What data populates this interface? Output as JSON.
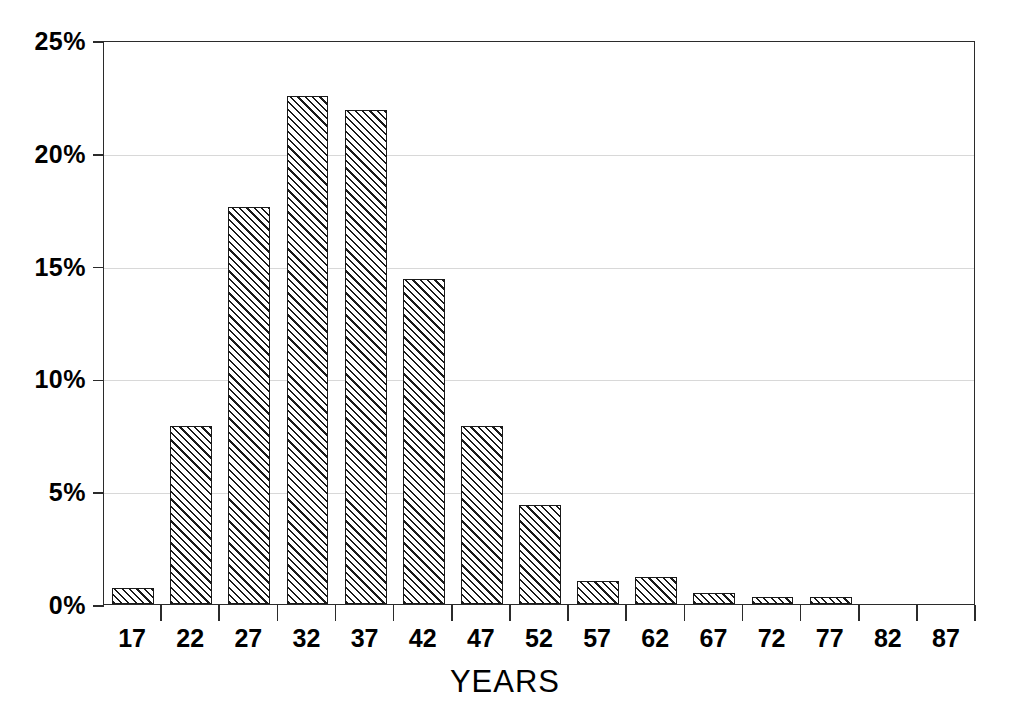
{
  "chart_data": {
    "type": "bar",
    "title": "",
    "subtitle": "",
    "xlabel": "YEARS",
    "ylabel": "",
    "categories": [
      "17",
      "22",
      "27",
      "32",
      "37",
      "42",
      "47",
      "52",
      "57",
      "62",
      "67",
      "72",
      "77",
      "82",
      "87"
    ],
    "values": [
      0.7,
      7.9,
      17.6,
      22.5,
      21.9,
      14.4,
      7.9,
      4.4,
      1.0,
      1.2,
      0.5,
      0.3,
      0.3,
      0.0,
      0.0
    ],
    "value_unit": "%",
    "ylim": [
      0,
      25
    ],
    "ytick_values": [
      0,
      5,
      10,
      15,
      20,
      25
    ],
    "ytick_labels": [
      "0%",
      "5%",
      "10%",
      "15%",
      "20%",
      "25%"
    ],
    "xtick_labels": [
      "17",
      "22",
      "27",
      "32",
      "37",
      "42",
      "47",
      "52",
      "57",
      "62",
      "67",
      "72",
      "77",
      "82",
      "87"
    ],
    "grid": "horizontal",
    "legend": "none",
    "bar_fill": "diagonal-hatch",
    "bar_edge_color": "#1a1a1a",
    "axis_color": "#2b2b2b",
    "grid_color": "#d8d8d8",
    "background_color": "#ffffff"
  }
}
